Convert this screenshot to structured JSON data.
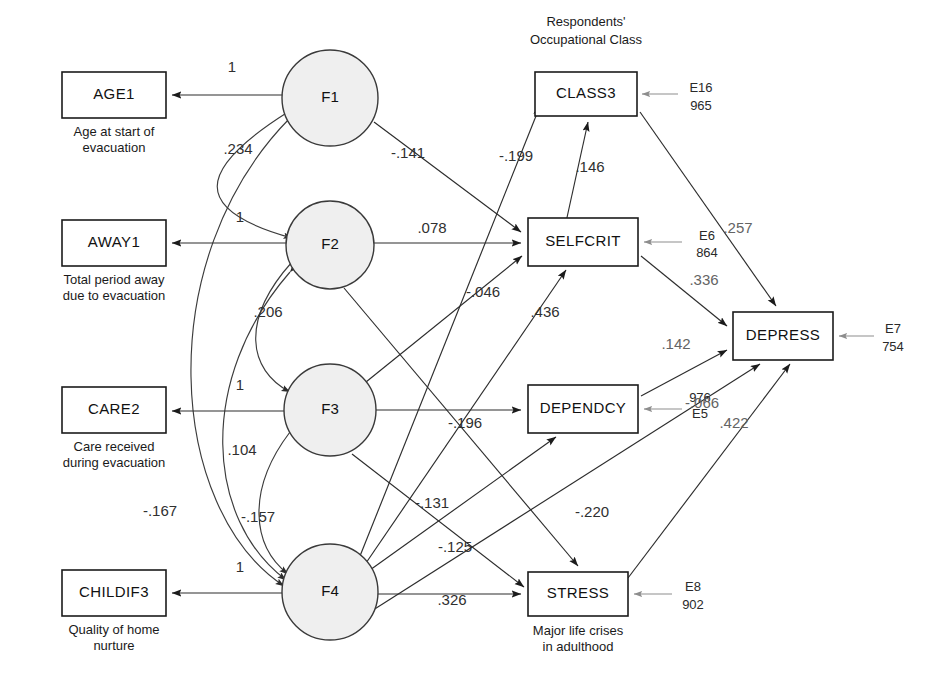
{
  "diagram": {
    "title_block": {
      "line1": "Respondents'",
      "line2": "Occupational Class"
    },
    "latent_factors": [
      {
        "id": "F1",
        "label": "F1",
        "cx": 330,
        "cy": 98,
        "r": 48
      },
      {
        "id": "F2",
        "label": "F2",
        "cx": 330,
        "cy": 245,
        "r": 44
      },
      {
        "id": "F3",
        "label": "F3",
        "cx": 330,
        "cy": 410,
        "r": 46
      },
      {
        "id": "F4",
        "label": "F4",
        "cx": 330,
        "cy": 592,
        "r": 48
      }
    ],
    "indicators": [
      {
        "id": "AGE1",
        "label": "AGE1",
        "caption_line1": "Age at start of",
        "caption_line2": "evacuation",
        "x": 62,
        "y": 72,
        "w": 104,
        "h": 46
      },
      {
        "id": "AWAY1",
        "label": "AWAY1",
        "caption_line1": "Total period away",
        "caption_line2": "due to evacuation",
        "x": 62,
        "y": 220,
        "w": 104,
        "h": 46
      },
      {
        "id": "CARE2",
        "label": "CARE2",
        "caption_line1": "Care received",
        "caption_line2": "during evacuation",
        "x": 62,
        "y": 387,
        "w": 104,
        "h": 46
      },
      {
        "id": "CHILDIF3",
        "label": "CHILDIF3",
        "caption_line1": "Quality of home",
        "caption_line2": "nurture",
        "x": 62,
        "y": 570,
        "w": 104,
        "h": 46
      }
    ],
    "outcomes": [
      {
        "id": "CLASS3",
        "label": "CLASS3",
        "caption_line1": "",
        "caption_line2": "",
        "x": 535,
        "y": 72,
        "w": 102,
        "h": 44,
        "error_label": "E16",
        "error_value": "965"
      },
      {
        "id": "SELFCRIT",
        "label": "SELFCRIT",
        "caption_line1": "",
        "caption_line2": "",
        "x": 528,
        "y": 218,
        "w": 110,
        "h": 48,
        "error_label": "E6",
        "error_value": "864"
      },
      {
        "id": "DEPENDCY",
        "label": "DEPENDCY",
        "caption_line1": "",
        "caption_line2": "",
        "x": 528,
        "y": 385,
        "w": 110,
        "h": 48,
        "error_label": "E5",
        "error_value": "976"
      },
      {
        "id": "DEPRESS",
        "label": "DEPRESS",
        "caption_line1": "",
        "caption_line2": "",
        "x": 733,
        "y": 312,
        "w": 100,
        "h": 48,
        "error_label": "E7",
        "error_value": "754"
      },
      {
        "id": "STRESS",
        "label": "STRESS",
        "caption_line1": "Major life crises",
        "caption_line2": "in adulthood",
        "x": 528,
        "y": 572,
        "w": 100,
        "h": 44,
        "error_label": "E8",
        "error_value": "902"
      }
    ],
    "loadings": [
      {
        "from": "F1",
        "to": "AGE1",
        "value": "1",
        "lx": 232,
        "ly": 72
      },
      {
        "from": "F2",
        "to": "AWAY1",
        "value": "1",
        "lx": 240,
        "ly": 222
      },
      {
        "from": "F3",
        "to": "CARE2",
        "value": "1",
        "lx": 240,
        "ly": 390
      },
      {
        "from": "F4",
        "to": "CHILDIF3",
        "value": "1",
        "lx": 240,
        "ly": 572
      }
    ],
    "correlations": [
      {
        "between": "F1-F2",
        "value": ".234",
        "lx": 238,
        "ly": 154
      },
      {
        "between": "F2-F3",
        "value": ".206",
        "lx": 268,
        "ly": 317
      },
      {
        "between": "F3-F4",
        "value": ".104",
        "lx": 242,
        "ly": 455
      },
      {
        "between": "F2-F4",
        "value": "-.157",
        "lx": 258,
        "ly": 522
      },
      {
        "between": "F1-F4",
        "value": "-.167",
        "lx": 160,
        "ly": 516
      }
    ],
    "structural_paths": [
      {
        "from": "F1",
        "to": "SELFCRIT",
        "value": "-.141",
        "lx": 408,
        "ly": 158
      },
      {
        "from": "F4",
        "to": "CLASS3",
        "value": "-.199",
        "lx": 516,
        "ly": 161
      },
      {
        "from": "CLASS3",
        "to": "SELFCRIT",
        "value": ".146",
        "lx": 590,
        "ly": 172
      },
      {
        "from": "F2",
        "to": "SELFCRIT",
        "value": ".078",
        "lx": 432,
        "ly": 233
      },
      {
        "from": "F3",
        "to": "SELFCRIT",
        "value": "-.046",
        "lx": 483,
        "ly": 297
      },
      {
        "from": "F4",
        "to": "SELFCRIT",
        "value": ".436",
        "lx": 545,
        "ly": 317
      },
      {
        "from": "F3",
        "to": "DEPENDCY",
        "value": "-.196",
        "lx": 465,
        "ly": 428
      },
      {
        "from": "F3",
        "to": "STRESS",
        "value": "-.131",
        "lx": 432,
        "ly": 508
      },
      {
        "from": "F4",
        "to": "DEPENDCY",
        "value": "-.125",
        "lx": 455,
        "ly": 552
      },
      {
        "from": "F2",
        "to": "STRESS",
        "value": "-.220",
        "lx": 592,
        "ly": 517
      },
      {
        "from": "F4",
        "to": "STRESS",
        "value": ".326",
        "lx": 452,
        "ly": 605
      },
      {
        "from": "CLASS3",
        "to": "DEPRESS",
        "value": ".257",
        "lx": 738,
        "ly": 233
      },
      {
        "from": "SELFCRIT",
        "to": "DEPRESS",
        "value": ".336",
        "lx": 704,
        "ly": 285
      },
      {
        "from": "DEPENDCY",
        "to": "DEPRESS",
        "value": ".142",
        "lx": 676,
        "ly": 349
      },
      {
        "from": "F4",
        "to": "DEPRESS",
        "value": "-.066",
        "lx": 702,
        "ly": 408
      },
      {
        "from": "STRESS",
        "to": "DEPRESS",
        "value": ".422",
        "lx": 734,
        "ly": 428
      }
    ]
  }
}
